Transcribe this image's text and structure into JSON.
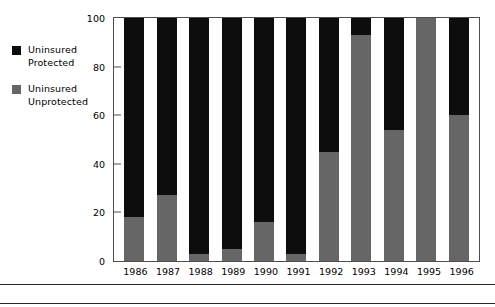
{
  "chart_data": {
    "type": "bar",
    "subtype": "stacked-bar-100-percent",
    "title": "",
    "xlabel": "",
    "ylabel": "",
    "ylim": [
      0,
      100
    ],
    "yticks": [
      0,
      20,
      40,
      60,
      80,
      100
    ],
    "ytick_labels": [
      "0",
      "20",
      "40",
      "60",
      "80",
      "100"
    ],
    "grid": false,
    "legend_position": "left-outside",
    "categories": [
      "1986",
      "1987",
      "1988",
      "1989",
      "1990",
      "1991",
      "1992",
      "1993",
      "1994",
      "1995",
      "1996"
    ],
    "series": [
      {
        "name": "Uninsured Unprotected",
        "color": "#666666",
        "values": [
          18,
          27,
          3,
          5,
          16,
          3,
          45,
          93,
          54,
          100,
          60
        ]
      },
      {
        "name": "Uninsured Protected",
        "color": "#0d0d0d",
        "values": [
          82,
          73,
          97,
          95,
          84,
          97,
          55,
          7,
          46,
          0,
          40
        ]
      }
    ]
  },
  "legend": {
    "items": [
      {
        "label": "Uninsured\nProtected",
        "color": "#0d0d0d",
        "swatch_name": "legend-swatch-uninsured-protected"
      },
      {
        "label": "Uninsured\nUnprotected",
        "color": "#666666",
        "swatch_name": "legend-swatch-uninsured-unprotected"
      }
    ]
  },
  "axis": {
    "frame_color": "#4d4d4d"
  }
}
